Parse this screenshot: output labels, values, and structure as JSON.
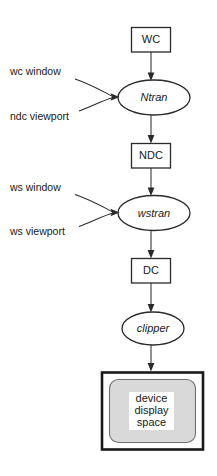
{
  "diagram": {
    "background_color": "#ffffff",
    "stroke_color": "#2a2a2a",
    "screen_fill_color": "#d9d9d9",
    "nodes": [
      {
        "id": "wc",
        "label": "WC",
        "shape": "rectangle",
        "style": "normal"
      },
      {
        "id": "ntran",
        "label": "Ntran",
        "shape": "ellipse",
        "style": "italic"
      },
      {
        "id": "ndc",
        "label": "NDC",
        "shape": "rectangle",
        "style": "normal"
      },
      {
        "id": "wstran",
        "label": "wstran",
        "shape": "ellipse",
        "style": "italic"
      },
      {
        "id": "dc",
        "label": "DC",
        "shape": "rectangle",
        "style": "normal"
      },
      {
        "id": "clipper",
        "label": "clipper",
        "shape": "ellipse",
        "style": "italic"
      }
    ],
    "screen": {
      "id": "device-display-space",
      "lines": [
        "device",
        "display",
        "space"
      ]
    },
    "side_labels": [
      {
        "id": "wc-window",
        "text": "wc window",
        "target": "ntran"
      },
      {
        "id": "ndc-viewport",
        "text": "ndc viewport",
        "target": "ntran"
      },
      {
        "id": "ws-window",
        "text": "ws window",
        "target": "wstran"
      },
      {
        "id": "ws-viewport",
        "text": "ws viewport",
        "target": "wstran"
      }
    ]
  }
}
